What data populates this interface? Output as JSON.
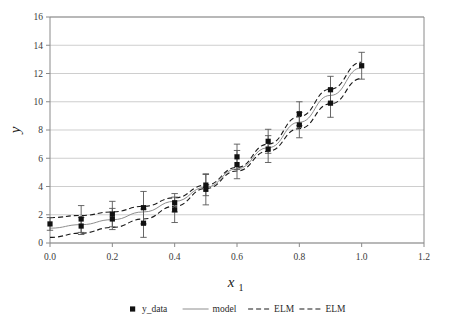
{
  "chart_data": {
    "type": "scatter",
    "title": "",
    "subtitle": "",
    "xlabel": "x",
    "xlabel_sub": "1",
    "ylabel": "y",
    "xlim": [
      0.0,
      1.2
    ],
    "ylim": [
      0,
      16
    ],
    "xticks": [
      "0.0",
      "0.2",
      "0.4",
      "0.6",
      "0.8",
      "1.0",
      "1.2"
    ],
    "xtick_values": [
      0.0,
      0.2,
      0.4,
      0.6,
      0.8,
      1.0,
      1.2
    ],
    "yticks": [
      "0",
      "2",
      "4",
      "6",
      "8",
      "10",
      "12",
      "14",
      "16"
    ],
    "ytick_values": [
      0,
      2,
      4,
      6,
      8,
      10,
      12,
      14,
      16
    ],
    "grid": "horizontal",
    "legend_position": "bottom",
    "legend": [
      {
        "label": "y_data",
        "style": "marker-square",
        "color": "#111111"
      },
      {
        "label": "model",
        "style": "solid-line",
        "color": "#8e8e8e"
      },
      {
        "label": "ELM",
        "style": "dashed-line",
        "color": "#1a1a1a"
      },
      {
        "label": "ELM",
        "style": "dashed-line",
        "color": "#1a1a1a"
      }
    ],
    "series": [
      {
        "name": "y_data",
        "type": "scatter-errorbar",
        "x": [
          0.0,
          0.1,
          0.1,
          0.2,
          0.2,
          0.3,
          0.3,
          0.4,
          0.4,
          0.5,
          0.5,
          0.6,
          0.6,
          0.7,
          0.7,
          0.8,
          0.8,
          0.9,
          0.9,
          1.0
        ],
        "y": [
          1.35,
          1.7,
          1.2,
          2.05,
          1.7,
          2.5,
          1.4,
          2.85,
          2.35,
          4.1,
          3.8,
          6.1,
          5.55,
          7.2,
          6.65,
          9.15,
          8.35,
          10.85,
          9.9,
          12.55
        ],
        "yerr": [
          0.45,
          0.95,
          0.6,
          0.9,
          0.75,
          1.15,
          1.0,
          0.65,
          0.9,
          0.75,
          1.1,
          0.9,
          1.0,
          0.85,
          0.95,
          0.85,
          0.9,
          0.95,
          1.0,
          0.95
        ]
      },
      {
        "name": "model",
        "type": "line",
        "style": "solid",
        "color": "#8e8e8e",
        "x": [
          0.0,
          0.1,
          0.2,
          0.3,
          0.4,
          0.5,
          0.6,
          0.7,
          0.8,
          0.9,
          1.0
        ],
        "y": [
          1.05,
          1.3,
          1.65,
          2.2,
          2.95,
          3.95,
          5.25,
          6.75,
          8.55,
          10.45,
          12.4
        ]
      },
      {
        "name": "ELM",
        "type": "line",
        "style": "dashed",
        "color": "#1a1a1a",
        "x": [
          0.0,
          0.1,
          0.2,
          0.3,
          0.4,
          0.5,
          0.6,
          0.7,
          0.8,
          0.9,
          1.0
        ],
        "y": [
          1.8,
          1.95,
          2.2,
          2.6,
          3.2,
          4.1,
          5.35,
          7.0,
          8.95,
          10.9,
          12.8
        ]
      },
      {
        "name": "ELM",
        "type": "line",
        "style": "dashed",
        "color": "#1a1a1a",
        "x": [
          0.0,
          0.1,
          0.2,
          0.3,
          0.4,
          0.5,
          0.6,
          0.7,
          0.8,
          0.9,
          1.0
        ],
        "y": [
          0.4,
          0.7,
          1.1,
          1.7,
          2.6,
          3.85,
          5.1,
          6.5,
          8.1,
          9.85,
          11.65
        ]
      }
    ]
  }
}
